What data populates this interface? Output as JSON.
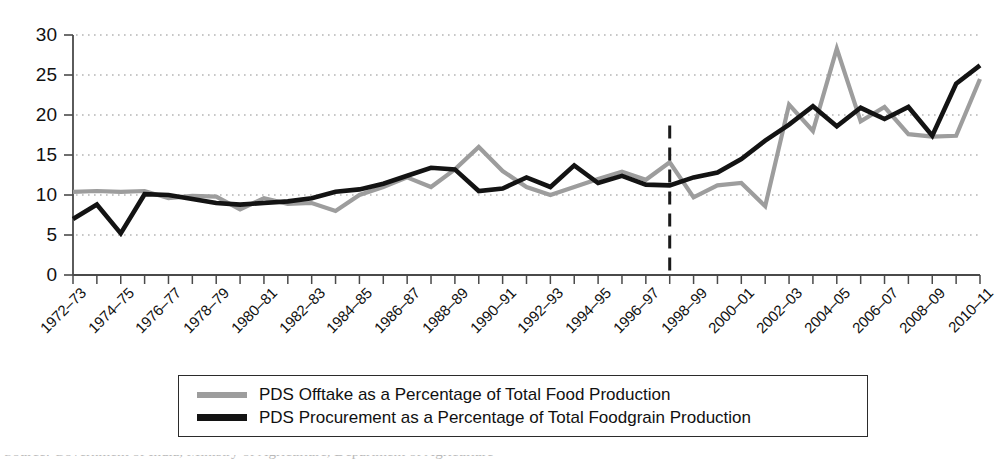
{
  "chart_data": {
    "type": "line",
    "title": "",
    "subtitle": "",
    "xlabel": "",
    "ylabel": "",
    "ylim": [
      0,
      30
    ],
    "ytick_values": [
      0,
      5,
      10,
      15,
      20,
      25,
      30
    ],
    "ytick_labels": [
      "0",
      "5",
      "10",
      "15",
      "20",
      "25",
      "30"
    ],
    "grid": "horizontal-dotted",
    "legend_position": "below-axes",
    "x": [
      "1972–73",
      "1973–74",
      "1974–75",
      "1975–76",
      "1976–77",
      "1977–78",
      "1978–79",
      "1979–80",
      "1980–81",
      "1981–82",
      "1982–83",
      "1983–84",
      "1984–85",
      "1985–86",
      "1986–87",
      "1987–88",
      "1988–89",
      "1989–90",
      "1990–91",
      "1991–92",
      "1992–93",
      "1993–94",
      "1994–95",
      "1995–96",
      "1996–97",
      "1997–98",
      "1998–99",
      "1999–00",
      "2000–01",
      "2001–02",
      "2002–03",
      "2003–04",
      "2004–05",
      "2005–06",
      "2006–07",
      "2007–08",
      "2008–09",
      "2009–10",
      "2010–11"
    ],
    "xtick_labels_shown": [
      "1972–73",
      "1974–75",
      "1976–77",
      "1978–79",
      "1980–81",
      "1982–83",
      "1984–85",
      "1986–87",
      "1988–89",
      "1990–91",
      "1992–93",
      "1994–95",
      "1996–97",
      "1998–99",
      "2000–01",
      "2002–03",
      "2004–05",
      "2006–07",
      "2008–09",
      "2010–11"
    ],
    "series": [
      {
        "name": "PDS Offtake as a Percentage of Total Food Production",
        "color": "#9d9d9d",
        "values": [
          10.4,
          10.5,
          10.4,
          10.5,
          9.6,
          9.9,
          9.8,
          8.2,
          9.6,
          8.9,
          9.0,
          8.0,
          10.0,
          11.0,
          12.2,
          11.0,
          13.2,
          16.0,
          13.0,
          11.0,
          10.0,
          11.0,
          12.0,
          12.9,
          11.9,
          14.1,
          9.7,
          11.2,
          11.5,
          8.6,
          21.3,
          18.0,
          28.3,
          19.2,
          21.0,
          17.6,
          17.3,
          17.4,
          24.5
        ]
      },
      {
        "name": "PDS Procurement as a Percentage of Total Foodgrain Production",
        "color": "#131313",
        "values": [
          7.0,
          8.8,
          5.2,
          10.1,
          10.0,
          9.5,
          9.0,
          8.8,
          9.0,
          9.2,
          9.6,
          10.4,
          10.7,
          11.4,
          12.4,
          13.4,
          13.2,
          10.5,
          10.8,
          12.2,
          11.0,
          13.7,
          11.5,
          12.4,
          11.3,
          11.2,
          12.2,
          12.8,
          14.5,
          16.8,
          18.8,
          21.1,
          18.6,
          20.9,
          19.5,
          21.0,
          17.4,
          23.9,
          26.2
        ]
      }
    ],
    "annotations": [
      {
        "type": "vertical-dashed-line",
        "at_x": "1997–98",
        "color": "#1a1a1a",
        "y_from": 0,
        "y_to": 18.7
      }
    ]
  },
  "legend": {
    "items": [
      {
        "label": "PDS Offtake as a Percentage of Total Food Production",
        "swatch": "offtake"
      },
      {
        "label": "PDS Procurement as a Percentage of Total Foodgrain Production",
        "swatch": "procurement"
      }
    ]
  },
  "caption": {
    "text": "Source: Government of India, Ministry of Agriculture, Department of Agriculture"
  },
  "colors": {
    "offtake": "#9d9d9d",
    "procurement": "#131313",
    "axis": "#4a4a4a",
    "grid": "#b5b5b5",
    "text": "#111111"
  }
}
